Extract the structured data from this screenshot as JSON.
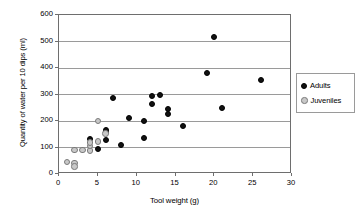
{
  "chart_data": {
    "type": "scatter",
    "title": "",
    "xlabel": "Tool weight (g)",
    "ylabel": "Quantity of water per 10 dips (ml)",
    "xlim": [
      0,
      30
    ],
    "ylim": [
      0,
      600
    ],
    "xticks": [
      0,
      5,
      10,
      15,
      20,
      25,
      30
    ],
    "yticks": [
      0,
      100,
      200,
      300,
      400,
      500,
      600
    ],
    "xtick_labels": [
      "0",
      "5",
      "10",
      "15",
      "20",
      "25",
      "30"
    ],
    "ytick_labels": [
      "0",
      "100",
      "200",
      "300",
      "400",
      "500",
      "600"
    ],
    "grid": "horizontal",
    "legend_position": "right",
    "series": [
      {
        "name": "Adults",
        "color": "#111111",
        "marker": "filled-circle",
        "points": [
          [
            4,
            132
          ],
          [
            5,
            95
          ],
          [
            6,
            128
          ],
          [
            6,
            158
          ],
          [
            6,
            165
          ],
          [
            7,
            288
          ],
          [
            8,
            109
          ],
          [
            9,
            210
          ],
          [
            11,
            200
          ],
          [
            11,
            136
          ],
          [
            12,
            295
          ],
          [
            12,
            263
          ],
          [
            13,
            300
          ],
          [
            14,
            245
          ],
          [
            14,
            228
          ],
          [
            16,
            180
          ],
          [
            19,
            380
          ],
          [
            20,
            517
          ],
          [
            21,
            250
          ],
          [
            26,
            355
          ]
        ]
      },
      {
        "name": "Juveniles",
        "color": "#c8c8c8",
        "marker": "open-circle",
        "points": [
          [
            1,
            45
          ],
          [
            2,
            42
          ],
          [
            2,
            28
          ],
          [
            2,
            90
          ],
          [
            3,
            90
          ],
          [
            4,
            88
          ],
          [
            4,
            105
          ],
          [
            4,
            118
          ],
          [
            5,
            123
          ],
          [
            5,
            200
          ],
          [
            6,
            152
          ]
        ]
      }
    ]
  },
  "legend": {
    "items": [
      {
        "label": "Adults",
        "key": "adults"
      },
      {
        "label": "Juveniles",
        "key": "juveniles"
      }
    ]
  }
}
